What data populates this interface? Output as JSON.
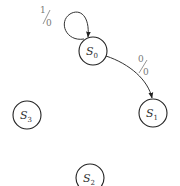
{
  "diagram": {
    "type": "state-transition-diagram",
    "states": [
      {
        "id": "S0",
        "name": "S",
        "sub": "0",
        "cx": 93,
        "cy": 51,
        "r": 14
      },
      {
        "id": "S1",
        "name": "S",
        "sub": "1",
        "cx": 153,
        "cy": 113,
        "r": 14
      },
      {
        "id": "S2",
        "name": "S",
        "sub": "2",
        "cx": 90,
        "cy": 178,
        "r": 14
      },
      {
        "id": "S3",
        "name": "S",
        "sub": "3",
        "cx": 27,
        "cy": 115,
        "r": 14
      }
    ],
    "transitions": [
      {
        "from": "S0",
        "to": "S0",
        "input": "1",
        "output": "0",
        "kind": "self-loop"
      },
      {
        "from": "S0",
        "to": "S1",
        "input": "0",
        "output": "0",
        "kind": "arc"
      }
    ],
    "colors": {
      "stroke": "#222222",
      "label": "#777777",
      "background": "#ffffff"
    }
  }
}
